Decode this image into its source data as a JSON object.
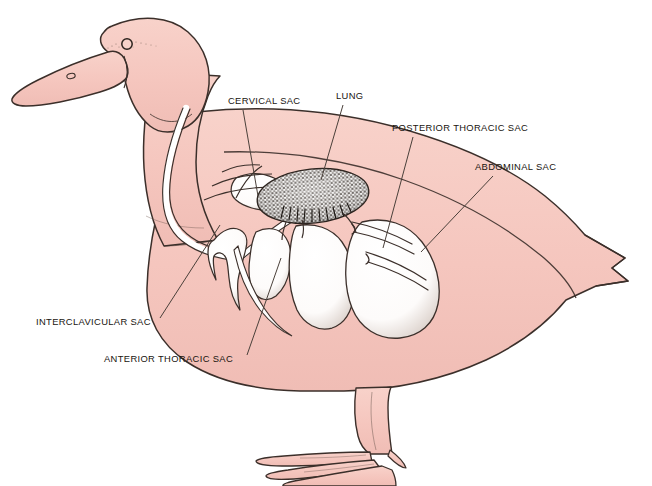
{
  "figure": {
    "view": "lateral-left",
    "system": "avian respiratory system",
    "background_color": "#ffffff",
    "body_fill_color": "#f6c8c0",
    "body_outline_color": "#3b2f2a",
    "air_sac_fill_color": "#ffffff",
    "lung_fill_color": "#6e6257",
    "leader_line_color": "#4a403a",
    "label_text_color": "#18140f"
  },
  "labels": [
    {
      "id": "cervical-sac",
      "text": "CERVICAL SAC",
      "text_x": 228,
      "text_y": 104,
      "anchor": "start",
      "leader": [
        [
          243,
          110
        ],
        [
          258,
          196
        ]
      ]
    },
    {
      "id": "lung",
      "text": "LUNG",
      "text_x": 336,
      "text_y": 99,
      "anchor": "start",
      "leader": [
        [
          343,
          105
        ],
        [
          321,
          180
        ]
      ]
    },
    {
      "id": "posterior-thoracic-sac",
      "text": "POSTERIOR THORACIC SAC",
      "text_x": 392,
      "text_y": 131,
      "anchor": "start",
      "leader": [
        [
          413,
          137
        ],
        [
          383,
          248
        ]
      ]
    },
    {
      "id": "abdominal-sac",
      "text": "ABDOMINAL SAC",
      "text_x": 475,
      "text_y": 170,
      "anchor": "start",
      "leader": [
        [
          493,
          176
        ],
        [
          421,
          252
        ]
      ]
    },
    {
      "id": "interclavicular-sac",
      "text": "INTERCLAVICULAR SAC",
      "text_x": 36,
      "text_y": 325,
      "anchor": "start",
      "leader": [
        [
          160,
          318
        ],
        [
          220,
          225
        ]
      ]
    },
    {
      "id": "anterior-thoracic-sac",
      "text": "ANTERIOR THORACIC SAC",
      "text_x": 104,
      "text_y": 362,
      "anchor": "start",
      "leader": [
        [
          247,
          355
        ],
        [
          281,
          258
        ]
      ]
    }
  ]
}
